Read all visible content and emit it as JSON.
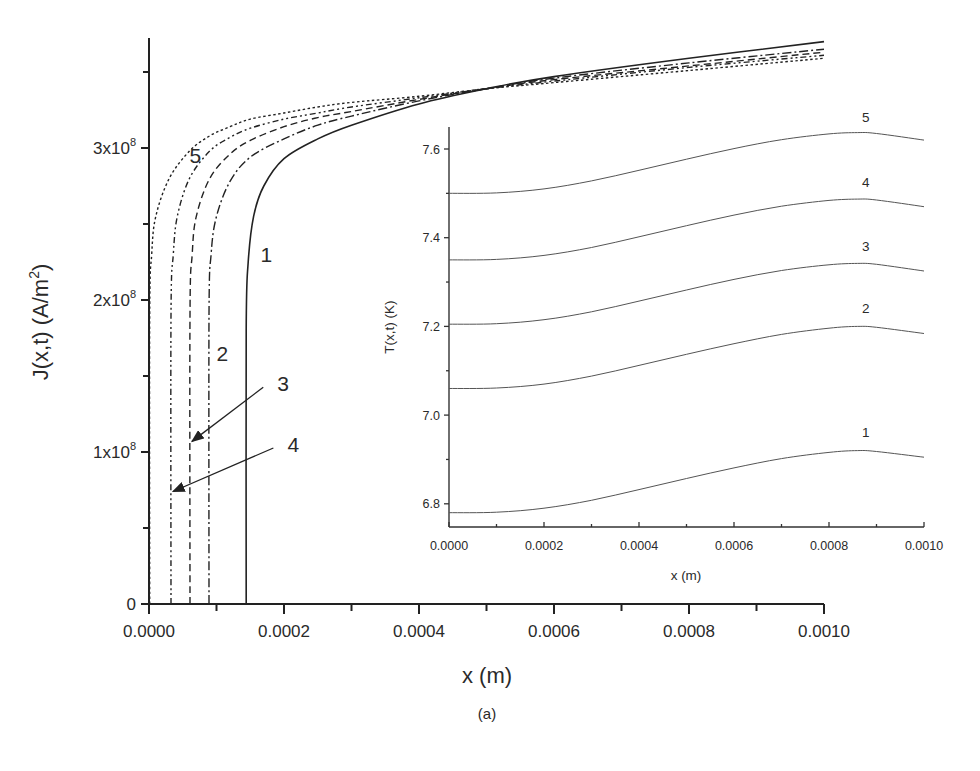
{
  "figure": {
    "caption": "(a)"
  },
  "chart_data": [
    {
      "type": "line",
      "title": "",
      "xlabel": "x (m)",
      "ylabel": "J(x,t) (A/m^2)",
      "ylabel_main": "J(x,t) (A/m",
      "ylabel_sup": "2",
      "ylabel_close": ")",
      "xlim": [
        0,
        0.001
      ],
      "ylim": [
        0,
        372000000.0
      ],
      "grid": false,
      "legend": "none (curves labeled inline 1-5)",
      "x_ticks": [
        "0.0000",
        "0.0002",
        "0.0004",
        "0.0006",
        "0.0008",
        "0.0010"
      ],
      "y_ticks": [
        {
          "value": 0,
          "label": "0",
          "mantissa": "0",
          "exp": ""
        },
        {
          "value": 100000000.0,
          "label": "1x10^8",
          "mantissa": "1x10",
          "exp": "8"
        },
        {
          "value": 200000000.0,
          "label": "2x10^8",
          "mantissa": "2x10",
          "exp": "8"
        },
        {
          "value": 300000000.0,
          "label": "3x10^8",
          "mantissa": "3x10",
          "exp": "8"
        }
      ],
      "series": [
        {
          "name": "1",
          "style": "solid",
          "x": [
            0.000144,
            0.000144,
            0.000147,
            0.000155,
            0.00017,
            0.0002,
            0.00025,
            0.0003,
            0.0004,
            0.0005,
            0.0006,
            0.0008,
            0.001
          ],
          "y": [
            0,
            180000000.0,
            225000000.0,
            255000000.0,
            275000000.0,
            293000000.0,
            306000000.0,
            315000000.0,
            329000000.0,
            339000000.0,
            347000000.0,
            359000000.0,
            370000000.0
          ]
        },
        {
          "name": "2",
          "style": "dash-dot",
          "x": [
            8.89e-05,
            8.89e-05,
            9.2e-05,
            0.0001,
            0.00012,
            0.00015,
            0.0002,
            0.00025,
            0.0003,
            0.0004,
            0.0005,
            0.0006,
            0.0008,
            0.001
          ],
          "y": [
            0,
            190000000.0,
            230000000.0,
            255000000.0,
            278000000.0,
            294000000.0,
            306000000.0,
            315000000.0,
            321000000.0,
            331000000.0,
            339000000.0,
            346000000.0,
            356000000.0,
            365000000.0
          ]
        },
        {
          "name": "3",
          "style": "dashed",
          "x": [
            6.07e-05,
            6.07e-05,
            6.4e-05,
            7e-05,
            9e-05,
            0.00012,
            0.00015,
            0.0002,
            0.00025,
            0.0003,
            0.0004,
            0.0005,
            0.0006,
            0.0008,
            0.001
          ],
          "y": [
            0,
            190000000.0,
            230000000.0,
            255000000.0,
            280000000.0,
            296000000.0,
            305000000.0,
            314000000.0,
            320000000.0,
            324000000.0,
            332000000.0,
            339000000.0,
            345000000.0,
            354000000.0,
            363000000.0
          ]
        },
        {
          "name": "4",
          "style": "dash-dot-dot",
          "x": [
            3.26e-05,
            3.26e-05,
            3.6e-05,
            4.2e-05,
            6e-05,
            9e-05,
            0.00012,
            0.00015,
            0.0002,
            0.00025,
            0.0003,
            0.0004,
            0.0005,
            0.0006,
            0.0008,
            0.001
          ],
          "y": [
            0,
            190000000.0,
            230000000.0,
            255000000.0,
            280000000.0,
            298000000.0,
            307000000.0,
            313000000.0,
            319000000.0,
            323000000.0,
            327000000.0,
            333000000.0,
            339000000.0,
            344000000.0,
            353000000.0,
            361000000.0
          ]
        },
        {
          "name": "5",
          "style": "dotted",
          "x": [
            1e-06,
            1e-06,
            4e-06,
            1e-05,
            3e-05,
            6e-05,
            9e-05,
            0.00012,
            0.00015,
            0.0002,
            0.00025,
            0.0003,
            0.0004,
            0.0005,
            0.0006,
            0.0008,
            0.001
          ],
          "y": [
            0,
            190000000.0,
            230000000.0,
            255000000.0,
            280000000.0,
            298000000.0,
            308000000.0,
            314000000.0,
            319000000.0,
            323000000.0,
            327000000.0,
            330000000.0,
            334000000.0,
            339000000.0,
            343000000.0,
            351000000.0,
            359000000.0
          ]
        }
      ],
      "annotations": [
        {
          "text": "1",
          "x": 0.000165,
          "y": 225000000.0
        },
        {
          "text": "2",
          "x": 0.0001,
          "y": 160000000.0
        },
        {
          "text": "3",
          "x": 0.00019,
          "y": 140000000.0,
          "arrow_to": {
            "x": 6.07e-05,
            "y": 107000000.0
          }
        },
        {
          "text": "4",
          "x": 0.000205,
          "y": 100000000.0,
          "arrow_to": {
            "x": 3.26e-05,
            "y": 74000000.0
          }
        },
        {
          "text": "5",
          "x": 6e-05,
          "y": 290000000.0
        }
      ]
    },
    {
      "type": "line",
      "title": "inset",
      "xlabel": "x (m)",
      "ylabel": "T(x,t) (K)",
      "xlim": [
        0,
        0.001
      ],
      "ylim": [
        6.75,
        7.65
      ],
      "grid": false,
      "x_ticks": [
        "0.0000",
        "0.0002",
        "0.0004",
        "0.0006",
        "0.0008",
        "0.0010"
      ],
      "y_ticks": [
        "6.8",
        "7.0",
        "7.2",
        "7.4",
        "7.6"
      ],
      "series": [
        {
          "name": "1",
          "style": "solid",
          "x": [
            0,
            0.0001,
            0.0002,
            0.0003,
            0.0004,
            0.0005,
            0.0006,
            0.0007,
            0.0008,
            0.00086,
            0.0009,
            0.001
          ],
          "y": [
            6.78,
            6.781,
            6.79,
            6.808,
            6.832,
            6.857,
            6.881,
            6.902,
            6.916,
            6.92,
            6.918,
            6.905
          ]
        },
        {
          "name": "2",
          "style": "solid",
          "x": [
            0,
            0.0001,
            0.0002,
            0.0003,
            0.0004,
            0.0005,
            0.0006,
            0.0007,
            0.0008,
            0.00086,
            0.0009,
            0.001
          ],
          "y": [
            7.06,
            7.061,
            7.07,
            7.088,
            7.112,
            7.137,
            7.161,
            7.182,
            7.196,
            7.2,
            7.198,
            7.184
          ]
        },
        {
          "name": "3",
          "style": "solid",
          "x": [
            0,
            0.0001,
            0.0002,
            0.0003,
            0.0004,
            0.0005,
            0.0006,
            0.0007,
            0.0008,
            0.00086,
            0.0009,
            0.001
          ],
          "y": [
            7.205,
            7.206,
            7.215,
            7.233,
            7.257,
            7.282,
            7.306,
            7.326,
            7.339,
            7.342,
            7.34,
            7.325
          ]
        },
        {
          "name": "4",
          "style": "solid",
          "x": [
            0,
            0.0001,
            0.0002,
            0.0003,
            0.0004,
            0.0005,
            0.0006,
            0.0007,
            0.0008,
            0.00086,
            0.0009,
            0.001
          ],
          "y": [
            7.35,
            7.351,
            7.36,
            7.378,
            7.402,
            7.427,
            7.451,
            7.471,
            7.484,
            7.487,
            7.485,
            7.47
          ]
        },
        {
          "name": "5",
          "style": "solid",
          "x": [
            0,
            0.0001,
            0.0002,
            0.0003,
            0.0004,
            0.0005,
            0.0006,
            0.0007,
            0.0008,
            0.00086,
            0.0009,
            0.001
          ],
          "y": [
            7.5,
            7.501,
            7.51,
            7.528,
            7.552,
            7.577,
            7.601,
            7.621,
            7.634,
            7.637,
            7.635,
            7.62
          ]
        }
      ],
      "annotations": [
        {
          "text": "1",
          "x": 0.00088,
          "y": 6.95
        },
        {
          "text": "2",
          "x": 0.00088,
          "y": 7.23
        },
        {
          "text": "3",
          "x": 0.00088,
          "y": 7.37
        },
        {
          "text": "4",
          "x": 0.00088,
          "y": 7.515
        },
        {
          "text": "5",
          "x": 0.00088,
          "y": 7.66
        }
      ]
    }
  ]
}
